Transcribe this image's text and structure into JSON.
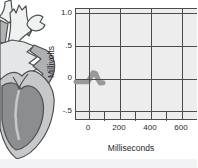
{
  "chart_data": {
    "type": "line",
    "title": "",
    "xlabel": "Milliseconds",
    "ylabel": "Millivolts",
    "x_tick_labels": [
      "0",
      "200",
      "400",
      "600"
    ],
    "x_ticks_ms": [
      0,
      200,
      400,
      600
    ],
    "x_minor_ticks_ms": [
      100,
      300,
      500,
      700
    ],
    "y_tick_labels": [
      "1.0",
      ".5",
      "0",
      "-.5"
    ],
    "y_ticks_mv": [
      1.0,
      0.5,
      0,
      -0.5
    ],
    "xlim": [
      -84,
      703
    ],
    "ylim": [
      -0.64,
      1.076
    ],
    "grid": true,
    "legend": "none",
    "series": [
      {
        "name": "ecg-trace",
        "x_ms": [
          -84,
          -8,
          4,
          26,
          44,
          58,
          72,
          90
        ],
        "y_mv": [
          -0.04,
          -0.04,
          0.0,
          0.1,
          0.085,
          0.0,
          -0.06,
          -0.055
        ]
      }
    ]
  },
  "colors": {
    "plot_background": "#ededee",
    "gridline": "#4a4c4e",
    "trace": "#97999b",
    "text": "#26282a",
    "heart_outline": "#4e5052",
    "heart_outer_wall": "#c6c8ca",
    "heart_ventricle": "#8b8d8f",
    "heart_atrium": "#aeb0b2",
    "heart_atria_cut": "#e5e6e7",
    "heart_vessel": "#f0f1f1"
  }
}
